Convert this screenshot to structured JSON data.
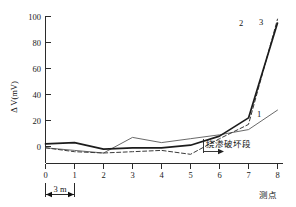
{
  "chart_data": {
    "type": "line",
    "title": "",
    "xlabel": "测点",
    "ylabel": "Δ V(mV)",
    "xlim": [
      0,
      8
    ],
    "ylim": [
      -10,
      100
    ],
    "x_ticks": [
      "0",
      "1",
      "2",
      "3",
      "4",
      "5",
      "6",
      "7",
      "8"
    ],
    "y_ticks": [
      "0",
      "20",
      "40",
      "60",
      "80",
      "100"
    ],
    "grid": false,
    "legend_position": "inline-end-labels",
    "x": [
      0,
      1,
      2,
      3,
      4,
      5,
      6,
      7,
      8
    ],
    "series": [
      {
        "name": "1",
        "label": "1",
        "style": "thin-solid",
        "color": "#585858",
        "values": [
          -1,
          -3,
          -5,
          7,
          3,
          6,
          9,
          13,
          28
        ]
      },
      {
        "name": "2",
        "label": "2",
        "style": "bold-solid",
        "color": "#1c1c1c",
        "values": [
          2,
          3,
          -2,
          -1,
          -1,
          1,
          8,
          22,
          95
        ]
      },
      {
        "name": "3",
        "label": "3",
        "style": "dashed",
        "color": "#3a3a3a",
        "values": [
          -1,
          -4,
          -5,
          -4,
          -3,
          -6,
          6,
          17,
          98
        ]
      }
    ],
    "annotations": [
      {
        "name": "failure-zone",
        "text": "绕渗破坏段",
        "x_start": 7,
        "note": "arrow pointing right from measurement point 7"
      },
      {
        "name": "scale-bar",
        "text": "3 m",
        "note": "spacing between adjacent measurement points"
      }
    ]
  },
  "labels": {
    "y_axis_title": "Δ V(mV)",
    "x_axis_title": "测点",
    "scale_text": "3 m",
    "failure_text": "绕渗破坏段",
    "series_1": "1",
    "series_2": "2",
    "series_3": "3",
    "y_100": "100",
    "y_80": "80",
    "y_60": "60",
    "y_40": "40",
    "y_20": "20",
    "y_0": "0",
    "x_0": "0",
    "x_1": "1",
    "x_2": "2",
    "x_3": "3",
    "x_4": "4",
    "x_5": "5",
    "x_6": "6",
    "x_7": "7",
    "x_8": "8"
  }
}
